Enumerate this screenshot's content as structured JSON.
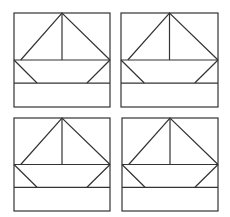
{
  "figure": {
    "stroke_color": "#333333",
    "background": "#ffffff",
    "panels": [
      {
        "id": "top-left",
        "x": 14,
        "y": 13,
        "w": 96,
        "h": 94
      },
      {
        "id": "top-right",
        "x": 121,
        "y": 13,
        "w": 97,
        "h": 94
      },
      {
        "id": "bottom-left",
        "x": 14,
        "y": 118,
        "w": 96,
        "h": 93
      },
      {
        "id": "bottom-right",
        "x": 122,
        "y": 118,
        "w": 96,
        "h": 93
      }
    ]
  }
}
